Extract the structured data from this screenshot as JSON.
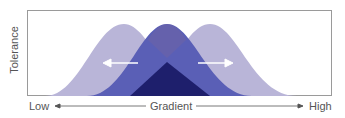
{
  "diagram": {
    "y_axis_label": "Tolerance",
    "x_axis": {
      "low_label": "Low",
      "center_label": "Gradient",
      "high_label": "High"
    },
    "curves": [
      {
        "name": "left-shifted-distribution",
        "color": "#b6b2d6"
      },
      {
        "name": "right-shifted-distribution",
        "color": "#b6b2d6"
      },
      {
        "name": "central-distribution",
        "color": "#5b5fb4"
      },
      {
        "name": "overlap-core",
        "color": "#1f1f6e"
      }
    ],
    "arrows": [
      {
        "name": "shift-left-arrow",
        "direction": "left"
      },
      {
        "name": "shift-right-arrow",
        "direction": "right"
      }
    ]
  }
}
